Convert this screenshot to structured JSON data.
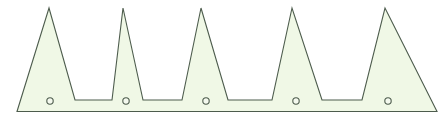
{
  "figure": {
    "title": "",
    "background_color": "#ffffff",
    "width": 447,
    "height": 120
  },
  "shape": {
    "name": "sawtooth-profile-outline",
    "fill_color": "#f0f8e6",
    "stroke_color": "#4d5c4d",
    "stroke_width": 1.1,
    "baseline_y": 111.5,
    "base_left_x": 17,
    "base_right_x": 437,
    "shoulder_y": 100,
    "peak_y": 8,
    "teeth": [
      {
        "index": 1,
        "peak_x": 49,
        "peak_y": 8,
        "left_base_x": 17,
        "right_base_x": 75
      },
      {
        "index": 2,
        "peak_x": 123,
        "peak_y": 8,
        "left_base_x": 112,
        "right_base_x": 143
      },
      {
        "index": 3,
        "peak_x": 201,
        "peak_y": 8,
        "left_base_x": 182,
        "right_base_x": 228
      },
      {
        "index": 4,
        "peak_x": 292,
        "peak_y": 8,
        "left_base_x": 272,
        "right_base_x": 322
      },
      {
        "index": 5,
        "peak_x": 385,
        "peak_y": 8,
        "left_base_x": 362,
        "right_base_x": 437
      }
    ],
    "notches": [
      {
        "index": 1,
        "left_x": 75,
        "right_x": 112,
        "floor_y": 100
      },
      {
        "index": 2,
        "left_x": 143,
        "right_x": 182,
        "floor_y": 100
      },
      {
        "index": 3,
        "left_x": 228,
        "right_x": 272,
        "floor_y": 100
      },
      {
        "index": 4,
        "left_x": 322,
        "right_x": 362,
        "floor_y": 100
      }
    ],
    "path_d": "M 17,111.5 L 49,8 L 75,100 L 112,100 L 123,8 L 143,100 L 182,100 L 201,8 L 228,100 L 272,100 L 292,8 L 322,100 L 362,100 L 385,8 L 437,111.5 Z"
  },
  "holes": {
    "name": "mounting-holes",
    "count": 5,
    "radius": 3.2,
    "fill_color": "#f4f9ee",
    "stroke_color": "#4d5c4d",
    "stroke_width": 1.1,
    "points": [
      {
        "index": 1,
        "cx": 50,
        "cy": 101
      },
      {
        "index": 2,
        "cx": 126,
        "cy": 101
      },
      {
        "index": 3,
        "cx": 206,
        "cy": 101
      },
      {
        "index": 4,
        "cx": 296,
        "cy": 101
      },
      {
        "index": 5,
        "cx": 388,
        "cy": 101
      }
    ]
  },
  "baseline": {
    "name": "bottom-edge-line",
    "x1": 17,
    "x2": 437,
    "y": 111.5,
    "color": "#4d5c4d"
  }
}
